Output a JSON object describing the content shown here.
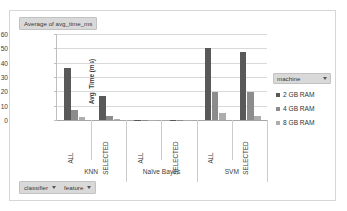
{
  "chart_data": {
    "type": "bar",
    "title": "Average of avg_time_ms",
    "xlabel": "",
    "ylabel": "Avg. Time (ms)",
    "ylim": [
      0,
      60
    ],
    "yticks": [
      0,
      10,
      20,
      30,
      40,
      50,
      60
    ],
    "grid": true,
    "legend_position": "right",
    "categories_level1": [
      "ALL",
      "SELECTED",
      "ALL",
      "SELECTED",
      "ALL",
      "SELECTED"
    ],
    "categories_level2": [
      "KNN",
      "Naïve Bayes",
      "SVM"
    ],
    "series": [
      {
        "name": "2 GB RAM",
        "color": "#595959",
        "values": [
          36.5,
          17.0,
          0.3,
          0.2,
          50.3,
          47.8
        ]
      },
      {
        "name": "4 GB RAM",
        "color": "#8c8c8c",
        "values": [
          7.1,
          3.0,
          0.2,
          0.1,
          19.2,
          19.8
        ]
      },
      {
        "name": "8 GB RAM",
        "color": "#adadad",
        "values": [
          1.9,
          0.7,
          0.1,
          0.1,
          4.6,
          2.6
        ]
      }
    ]
  },
  "title_field": {
    "label": "Average of avg_time_ms"
  },
  "legend": {
    "filter_label": "machine",
    "entries": [
      {
        "label": "2 GB RAM"
      },
      {
        "label": "4 GB RAM"
      },
      {
        "label": "8 GB RAM"
      }
    ]
  },
  "bottom_filters": [
    {
      "label": "classifier"
    },
    {
      "label": "feature"
    }
  ]
}
